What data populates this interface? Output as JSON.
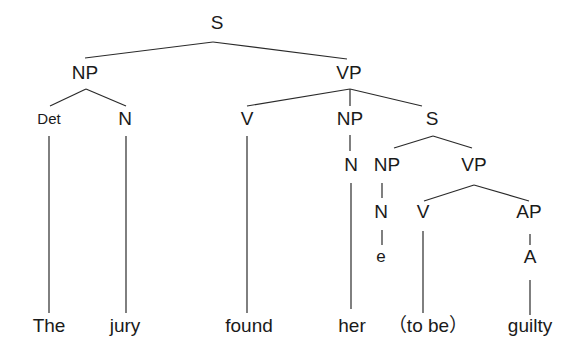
{
  "diagram": {
    "type": "syntax-tree",
    "nodes": {
      "s_root": {
        "label": "S",
        "x": 217,
        "y": 29,
        "size": 19
      },
      "np_subj": {
        "label": "NP",
        "x": 85,
        "y": 79,
        "size": 19
      },
      "vp_main": {
        "label": "VP",
        "x": 349,
        "y": 79,
        "size": 19
      },
      "det": {
        "label": "Det",
        "x": 49,
        "y": 124,
        "size": 15
      },
      "n_jury": {
        "label": "N",
        "x": 125,
        "y": 125,
        "size": 19
      },
      "v_found": {
        "label": "V",
        "x": 247,
        "y": 125,
        "size": 19
      },
      "np_obj": {
        "label": "NP",
        "x": 350,
        "y": 125,
        "size": 19
      },
      "s_embedded": {
        "label": "S",
        "x": 432,
        "y": 125,
        "size": 19
      },
      "n_her": {
        "label": "N",
        "x": 351,
        "y": 171,
        "size": 19
      },
      "np_empty": {
        "label": "NP",
        "x": 387,
        "y": 171,
        "size": 19
      },
      "vp_embedded": {
        "label": "VP",
        "x": 474,
        "y": 171,
        "size": 19
      },
      "n_empty": {
        "label": "N",
        "x": 381,
        "y": 218,
        "size": 19
      },
      "v_tobe": {
        "label": "V",
        "x": 423,
        "y": 218,
        "size": 19
      },
      "ap": {
        "label": "AP",
        "x": 529,
        "y": 218,
        "size": 19
      },
      "e_empty": {
        "label": "e",
        "x": 381,
        "y": 262,
        "size": 17
      },
      "a": {
        "label": "A",
        "x": 530,
        "y": 263,
        "size": 19
      }
    },
    "words": {
      "w1": {
        "label": "The",
        "x": 49,
        "y": 332
      },
      "w2": {
        "label": "jury",
        "x": 125,
        "y": 332
      },
      "w3": {
        "label": "found",
        "x": 249,
        "y": 332
      },
      "w4": {
        "label": "her",
        "x": 352,
        "y": 332
      },
      "w5": {
        "label": "（to be）",
        "x": 428,
        "y": 332
      },
      "w6": {
        "label": "guilty",
        "x": 530,
        "y": 332
      }
    }
  }
}
